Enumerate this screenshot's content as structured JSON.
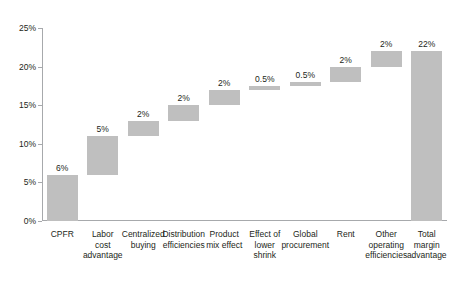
{
  "chart_data": {
    "type": "bar",
    "subtype": "waterfall",
    "title": "",
    "xlabel": "",
    "ylabel": "",
    "ylim": [
      0,
      25
    ],
    "ytick_labels": [
      "0%",
      "5%",
      "10%",
      "15%",
      "20%",
      "25%"
    ],
    "ytick_values": [
      0,
      5,
      10,
      15,
      20,
      25
    ],
    "grid": false,
    "legend": null,
    "bar_color": "#bfbfbf",
    "axis_color": "#a7a9ac",
    "categories": [
      "CPFR",
      "Labor\ncost\nadvantage",
      "Centralized\nbuying",
      "Distribution\nefficiencies",
      "Product\nmix effect",
      "Effect of\nlower\nshrink",
      "Global\nprocurement",
      "Rent",
      "Other\noperating\nefficiencies",
      "Total\nmargin\nadvantage"
    ],
    "values": [
      6,
      5,
      2,
      2,
      2,
      0.5,
      0.5,
      2,
      2,
      22
    ],
    "value_labels": [
      "6%",
      "5%",
      "2%",
      "2%",
      "2%",
      "0.5%",
      "0.5%",
      "2%",
      "2%",
      "22%"
    ],
    "bases": [
      0,
      6,
      11,
      13,
      15,
      17,
      17.5,
      18,
      20,
      0
    ],
    "tops": [
      6,
      11,
      13,
      15,
      17,
      17.5,
      18,
      20,
      22,
      22
    ],
    "is_total": [
      false,
      false,
      false,
      false,
      false,
      false,
      false,
      false,
      false,
      true
    ]
  },
  "title_remnant": "· ·   · ·"
}
